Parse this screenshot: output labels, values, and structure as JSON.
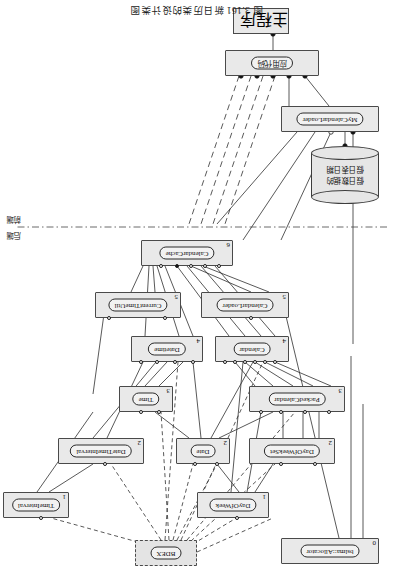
{
  "figure": {
    "caption": "图 3.161  新日历类的设计类图",
    "width": 393,
    "height": 584,
    "rotation_note": "page printed upside down (180°)",
    "tier_divider": {
      "style": "dash-dot",
      "y": 357
    },
    "tiers": {
      "upper_label": "后端",
      "lower_label": "前端"
    }
  },
  "components": [
    {
      "id": "bslma_allocator",
      "name": "bslma::Allocator",
      "level": "0",
      "x": 14,
      "y": 20,
      "w": 98,
      "h": 26,
      "style": "solid"
    },
    {
      "id": "bdex",
      "name": "BDEX",
      "level": "",
      "x": 196,
      "y": 18,
      "w": 62,
      "h": 26,
      "style": "dashed"
    },
    {
      "id": "dayofweek",
      "name": "DayOfWeek",
      "level": "1",
      "x": 124,
      "y": 66,
      "w": 72,
      "h": 26,
      "style": "solid"
    },
    {
      "id": "timeinterval",
      "name": "TimeInterval",
      "level": "1",
      "x": 324,
      "y": 66,
      "w": 66,
      "h": 26,
      "style": "solid"
    },
    {
      "id": "dayofweekset",
      "name": "DayOfWeekSet",
      "level": "2",
      "x": 58,
      "y": 120,
      "w": 86,
      "h": 26,
      "style": "solid"
    },
    {
      "id": "date",
      "name": "Date",
      "level": "2",
      "x": 163,
      "y": 120,
      "w": 54,
      "h": 26,
      "style": "solid"
    },
    {
      "id": "datetimeinterval",
      "name": "DateTimeInterval",
      "level": "2",
      "x": 249,
      "y": 120,
      "w": 86,
      "h": 26,
      "style": "solid"
    },
    {
      "id": "packedcalendar",
      "name": "PackedCalendar",
      "level": "3",
      "x": 48,
      "y": 172,
      "w": 96,
      "h": 26,
      "style": "solid"
    },
    {
      "id": "time",
      "name": "Time",
      "level": "3",
      "x": 220,
      "y": 172,
      "w": 54,
      "h": 26,
      "style": "solid"
    },
    {
      "id": "calendar",
      "name": "Calendar",
      "level": "4",
      "x": 104,
      "y": 222,
      "w": 74,
      "h": 26,
      "style": "solid"
    },
    {
      "id": "datetime",
      "name": "Datetime",
      "level": "4",
      "x": 190,
      "y": 222,
      "w": 72,
      "h": 26,
      "style": "solid"
    },
    {
      "id": "calendarloader",
      "name": "CalendarLoader",
      "level": "5",
      "x": 104,
      "y": 266,
      "w": 88,
      "h": 26,
      "style": "solid"
    },
    {
      "id": "currenttimeutil",
      "name": "CurrentTimeUtil",
      "level": "5",
      "x": 212,
      "y": 266,
      "w": 86,
      "h": 26,
      "style": "solid"
    },
    {
      "id": "calendarcache",
      "name": "CalendarCache",
      "level": "6",
      "x": 160,
      "y": 318,
      "w": 92,
      "h": 26,
      "style": "solid"
    },
    {
      "id": "mycalendarloader",
      "name": "MyCalendarLoader",
      "level": "",
      "x": 14,
      "y": 452,
      "w": 98,
      "h": 26,
      "style": "solid"
    },
    {
      "id": "app_code",
      "name": "应用代码",
      "level": "",
      "x": 74,
      "y": 508,
      "w": 94,
      "h": 26,
      "style": "solid",
      "cjk": true
    },
    {
      "id": "main_program",
      "name": "主程序",
      "level": "",
      "x": 104,
      "y": 550,
      "w": 56,
      "h": 26,
      "style": "plain",
      "cjk": true
    }
  ],
  "datastore": {
    "id": "holiday_db",
    "label_lines": [
      "假日数据的",
      "假日表日期"
    ],
    "x": 14,
    "y": 380,
    "w": 68,
    "h": 58
  },
  "legend": {
    "ball_open": "provided/required interface (open)",
    "ball_filled": "bound interface (filled)"
  },
  "colors": {
    "box_fill": "#e9e9e9",
    "box_border": "#4a4a4a",
    "lozenge_fill": "#f2f2f2",
    "lozenge_border": "#2b2b2b",
    "line": "#2f2f2f",
    "cylinder_fill": "#e6e6e6",
    "page_bg": "#ffffff"
  }
}
